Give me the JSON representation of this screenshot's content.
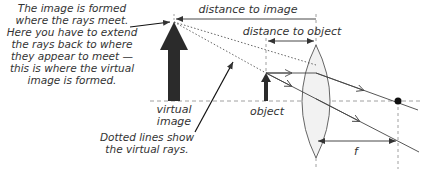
{
  "diagram": {
    "colors": {
      "ink": "#333333",
      "arrow_fill": "#2b2b2b",
      "lens_fill": "#f2f2f2",
      "dashed": "#888888",
      "background": "#ffffff"
    },
    "annotations": {
      "image_formed_note": [
        "The image is formed",
        "where the rays meet.",
        "Here you have to extend",
        "the rays back to where",
        "they appear to meet —",
        "this is where the virtual",
        "image is formed."
      ],
      "dotted_lines_note": [
        "Dotted lines show",
        "the virtual rays."
      ]
    },
    "labels": {
      "distance_to_image": "distance to image",
      "distance_to_object": "distance to object",
      "virtual_image": [
        "virtual",
        "image"
      ],
      "object": "object",
      "focal_length": "f"
    },
    "elements": {
      "principal_axis": {
        "y": 101
      },
      "virtual_image_arrow": {
        "x": 174,
        "tip_y": 22,
        "base_y": 101
      },
      "object_arrow": {
        "x": 266,
        "tip_y": 73,
        "base_y": 101
      },
      "lens": {
        "x": 316,
        "top_y": 45,
        "bottom_y": 158
      },
      "focal_point": {
        "x": 398,
        "y": 101
      }
    }
  }
}
